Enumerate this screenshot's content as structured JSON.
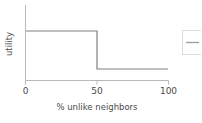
{
  "chart_data": {
    "type": "line",
    "title": "",
    "subtitle": "",
    "xlabel": "% unlike neighbors",
    "ylabel": "utility",
    "xlim": [
      0,
      100
    ],
    "ylim": [
      0,
      1
    ],
    "grid": false,
    "xticks": [
      0,
      50,
      100
    ],
    "xtick_labels": [
      "0",
      "50",
      "100"
    ],
    "yticks": [],
    "ytick_labels": [],
    "legend": {
      "position": "right-outside",
      "clipped": true,
      "entries": [
        {
          "label": "",
          "color": "#808080"
        }
      ]
    },
    "series": [
      {
        "name": "utility",
        "type": "step",
        "color": "#808080",
        "linewidth": 1.2,
        "x": [
          0,
          50,
          50,
          100
        ],
        "y": [
          0.8,
          0.8,
          0.12,
          0.12
        ]
      }
    ],
    "annotations": []
  },
  "axes": {
    "x_tick_0": "0",
    "x_tick_50": "50",
    "x_tick_100": "100",
    "x_axis_title": "% unlike neighbors",
    "y_axis_title": "utility"
  },
  "colors": {
    "line": "#808080",
    "axis": "#b0b0b0",
    "text": "#4a4a4a",
    "background": "#ffffff",
    "legend_border": "#d8d8d8"
  }
}
